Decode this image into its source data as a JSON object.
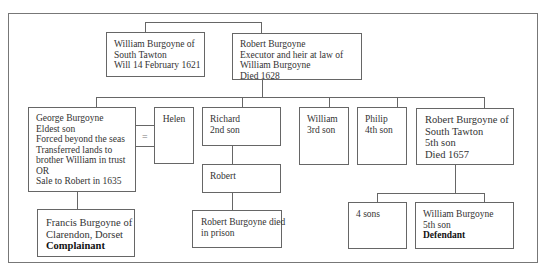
{
  "diagram": {
    "type": "family-tree",
    "nodes": {
      "william_sr": {
        "lines": [
          "William Burgoyne of",
          "South Tawton",
          "Will 14 February 1621"
        ]
      },
      "robert_sr": {
        "lines": [
          "Robert Burgoyne",
          "Executor and heir at law of",
          "William Burgoyne",
          "Died 1628"
        ]
      },
      "george": {
        "lines": [
          "George Burgoyne",
          "Eldest son",
          "Forced beyond the seas",
          "Transferred lands to",
          "brother William in trust",
          "OR",
          "Sale to Robert in 1635"
        ]
      },
      "helen": {
        "lines": [
          "Helen"
        ]
      },
      "marriage_symbol": "=",
      "richard": {
        "lines": [
          "Richard",
          "2nd son"
        ]
      },
      "william_3rd": {
        "lines": [
          "William",
          "3rd son"
        ]
      },
      "philip": {
        "lines": [
          "Philip",
          "4th son"
        ]
      },
      "robert_5th": {
        "lines": [
          "Robert Burgoyne of",
          "South Tawton",
          "5th son",
          "Died 1657"
        ]
      },
      "robert_jr": {
        "lines": [
          "Robert"
        ]
      },
      "robert_prison": {
        "lines": [
          "Robert Burgoyne died",
          "in prison"
        ]
      },
      "francis": {
        "lines": [
          "Francis Burgoyne of",
          "Clarendon, Dorset"
        ],
        "role": "Complainant"
      },
      "four_sons": {
        "lines": [
          "4 sons"
        ]
      },
      "william_def": {
        "lines": [
          "William Burgoyne",
          "5th son"
        ],
        "role": "Defendant"
      }
    }
  }
}
